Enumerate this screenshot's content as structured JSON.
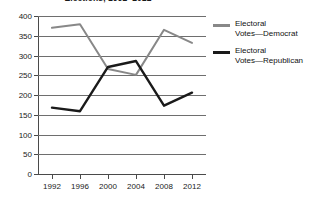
{
  "chart_data": {
    "type": "line",
    "title": "Elections, 1992–2012",
    "xlabel": "",
    "ylabel": "",
    "categories": [
      "1992",
      "1996",
      "2000",
      "2004",
      "2008",
      "2012"
    ],
    "x": [
      1992,
      1996,
      2000,
      2004,
      2008,
      2012
    ],
    "series": [
      {
        "name": "Electoral Votes—Democrat",
        "color": "#888888",
        "values": [
          370,
          379,
          266,
          251,
          365,
          332
        ]
      },
      {
        "name": "Electoral Votes—Republican",
        "color": "#1a1a1a",
        "values": [
          168,
          159,
          271,
          286,
          173,
          206
        ]
      }
    ],
    "ylim": [
      0,
      400
    ],
    "yticks": [
      0,
      50,
      100,
      150,
      200,
      250,
      300,
      350,
      400
    ],
    "ytick_labels": [
      "0",
      "50",
      "100",
      "150",
      "200",
      "250",
      "300",
      "350",
      "400"
    ],
    "grid": true,
    "legend_position": "right"
  },
  "legend": {
    "entries": [
      {
        "label_line1": "Electoral",
        "label_line2": "Votes—Democrat",
        "color": "#888888"
      },
      {
        "label_line1": "Electoral",
        "label_line2": "Votes—Republican",
        "color": "#1a1a1a"
      }
    ]
  }
}
